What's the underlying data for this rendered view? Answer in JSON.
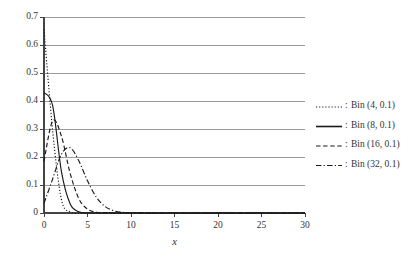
{
  "chart_data": {
    "type": "line",
    "title": "",
    "subtitle": "",
    "xlabel": "x",
    "ylabel": "",
    "xlim": [
      0,
      30
    ],
    "ylim": [
      0,
      0.7
    ],
    "xticks": [
      "0",
      "5",
      "10",
      "15",
      "20",
      "25",
      "30"
    ],
    "xtick_values": [
      0,
      5,
      10,
      15,
      20,
      25,
      30
    ],
    "yticks": [
      "0",
      "0.1",
      "0.2",
      "0.3",
      "0.4",
      "0.5",
      "0.6",
      "0.7"
    ],
    "ytick_values": [
      0,
      0.1,
      0.2,
      0.3,
      0.4,
      0.5,
      0.6,
      0.7
    ],
    "grid": true,
    "grid_axis": "y",
    "grid_color": "#9a9a9a",
    "axis_color": "#444444",
    "legend_position": "right",
    "legend_separator": ":",
    "x": [
      0,
      1,
      2,
      3,
      4,
      5,
      6,
      7,
      8,
      9,
      10,
      11,
      12,
      13,
      14,
      15,
      16,
      17,
      18,
      19,
      20,
      21,
      22,
      23,
      24,
      25,
      26,
      27,
      28,
      29,
      30
    ],
    "series": [
      {
        "name": "Bin (4, 0.1)",
        "style": "dotted",
        "color": "#1a1a1a",
        "values": [
          0.6561,
          0.2916,
          0.0486,
          0.0036,
          0.0001,
          0,
          0,
          0,
          0,
          0,
          0,
          0,
          0,
          0,
          0,
          0,
          0,
          0,
          0,
          0,
          0,
          0,
          0,
          0,
          0,
          0,
          0,
          0,
          0,
          0,
          0
        ]
      },
      {
        "name": "Bin (8, 0.1)",
        "style": "solid",
        "color": "#1a1a1a",
        "values": [
          0.4305,
          0.3826,
          0.1488,
          0.0331,
          0.0046,
          0.0004,
          0.0,
          0,
          0,
          0,
          0,
          0,
          0,
          0,
          0,
          0,
          0,
          0,
          0,
          0,
          0,
          0,
          0,
          0,
          0,
          0,
          0,
          0,
          0,
          0,
          0
        ]
      },
      {
        "name": "Bin (16, 0.1)",
        "style": "dashed",
        "color": "#1a1a1a",
        "values": [
          0.1853,
          0.3294,
          0.2745,
          0.1423,
          0.0514,
          0.0137,
          0.0028,
          0.0004,
          0.0001,
          0,
          0,
          0,
          0,
          0,
          0,
          0,
          0,
          0,
          0,
          0,
          0,
          0,
          0,
          0,
          0,
          0,
          0,
          0,
          0,
          0,
          0
        ]
      },
      {
        "name": "Bin (32, 0.1)",
        "style": "dashdot",
        "color": "#1a1a1a",
        "values": [
          0.0343,
          0.122,
          0.2099,
          0.2331,
          0.1865,
          0.1148,
          0.0574,
          0.0237,
          0.0083,
          0.0025,
          0.0007,
          0.0002,
          0.0,
          0,
          0,
          0,
          0,
          0,
          0,
          0,
          0,
          0,
          0,
          0,
          0,
          0,
          0,
          0,
          0,
          0,
          0
        ]
      }
    ]
  }
}
